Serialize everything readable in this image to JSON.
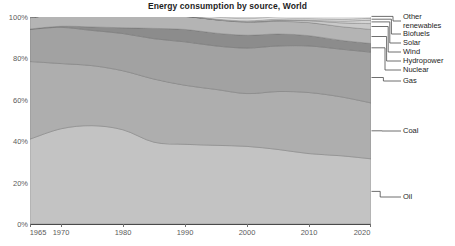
{
  "title": "Energy consumption by source, World",
  "axes": {
    "y_ticks": [
      "0%",
      "20%",
      "40%",
      "60%",
      "80%",
      "100%"
    ],
    "x_ticks": [
      "1965",
      "1970",
      "1980",
      "1990",
      "2000",
      "2010",
      "2020"
    ]
  },
  "legend": {
    "items": [
      {
        "label": "Other renewables"
      },
      {
        "label": "Biofuels"
      },
      {
        "label": "Solar"
      },
      {
        "label": "Wind"
      },
      {
        "label": "Hydropower"
      },
      {
        "label": "Nuclear"
      },
      {
        "label": "Gas"
      },
      {
        "label": "Coal"
      },
      {
        "label": "Oil"
      }
    ]
  },
  "colors": {
    "oil": "#c3c3c3",
    "coal": "#aeaeae",
    "gas": "#a2a2a2",
    "nuclear": "#8c8c8c",
    "hydropower": "#b4b4b4",
    "wind": "#c9c9c9",
    "solar": "#d4d4d4",
    "biofuels": "#dcdcdc",
    "other_renewables": "#e4e4e4",
    "grid": "#8f8f8f",
    "axis": "#4a4a4a",
    "text": "#1d1d1d",
    "tick_text": "#5b5b5b"
  },
  "chart_data": {
    "type": "area",
    "stacked": true,
    "normalized": true,
    "title": "Energy consumption by source, World",
    "xlabel": "",
    "ylabel": "",
    "xlim": [
      1965,
      2020
    ],
    "ylim": [
      0,
      100
    ],
    "grid": true,
    "legend_position": "right",
    "x": [
      1965,
      1970,
      1975,
      1980,
      1985,
      1990,
      1995,
      2000,
      2005,
      2010,
      2015,
      2020
    ],
    "series": [
      {
        "name": "Oil",
        "values": [
          41.0,
          46.0,
          47.5,
          45.5,
          39.5,
          38.5,
          38.0,
          37.5,
          36.0,
          34.0,
          33.0,
          31.5
        ]
      },
      {
        "name": "Coal",
        "values": [
          37.5,
          31.5,
          29.0,
          28.5,
          30.5,
          28.5,
          27.0,
          25.5,
          28.0,
          29.5,
          28.5,
          27.0
        ]
      },
      {
        "name": "Gas",
        "values": [
          15.5,
          17.5,
          17.0,
          18.0,
          19.5,
          21.0,
          21.0,
          22.0,
          22.0,
          22.5,
          23.0,
          24.5
        ]
      },
      {
        "name": "Nuclear",
        "values": [
          0.2,
          0.5,
          1.7,
          2.8,
          5.0,
          6.0,
          6.2,
          6.2,
          5.8,
          5.0,
          4.3,
          4.2
        ]
      },
      {
        "name": "Hydropower",
        "values": [
          5.5,
          5.8,
          6.0,
          6.0,
          6.2,
          6.3,
          6.4,
          6.3,
          6.1,
          6.3,
          6.6,
          6.8
        ]
      },
      {
        "name": "Wind",
        "values": [
          0.0,
          0.0,
          0.0,
          0.0,
          0.0,
          0.05,
          0.1,
          0.2,
          0.4,
          0.9,
          1.8,
          2.8
        ]
      },
      {
        "name": "Solar",
        "values": [
          0.0,
          0.0,
          0.0,
          0.0,
          0.0,
          0.0,
          0.02,
          0.03,
          0.1,
          0.2,
          0.8,
          1.7
        ]
      },
      {
        "name": "Biofuels",
        "values": [
          0.0,
          0.0,
          0.0,
          0.05,
          0.1,
          0.2,
          0.3,
          0.4,
          0.6,
          0.8,
          0.9,
          0.9
        ]
      },
      {
        "name": "Other renewables",
        "values": [
          0.3,
          0.4,
          0.5,
          0.6,
          0.7,
          0.8,
          0.9,
          1.0,
          1.1,
          1.3,
          1.5,
          1.8
        ]
      }
    ]
  }
}
